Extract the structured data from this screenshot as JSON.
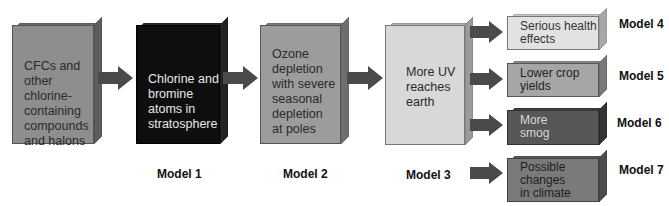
{
  "diagram": {
    "type": "flowchart",
    "boxes": [
      {
        "id": "box-cfcs",
        "text": "CFCs and other chlorine-containing compounds and halons",
        "lines": [
          "CFCs and",
          "other",
          "chlorine-",
          "containing",
          "compounds",
          "and halons"
        ],
        "fill": "#8e8e8e",
        "text_color": "#2a2a2a"
      },
      {
        "id": "box-chlorine",
        "text": "Chlorine and bromine atoms in stratosphere",
        "lines": [
          "Chlorine and",
          "bromine",
          "atoms in",
          "stratosphere"
        ],
        "fill": "#0e0e0e",
        "text_color": "#e8e8e8"
      },
      {
        "id": "box-ozone",
        "text": "Ozone depletion with severe seasonal depletion at poles",
        "lines": [
          "Ozone",
          "depletion",
          "with severe",
          "seasonal",
          "depletion",
          "at poles"
        ],
        "fill": "#9c9c9c",
        "text_color": "#2a2a2a"
      },
      {
        "id": "box-uv",
        "text": "More UV reaches earth",
        "lines": [
          "More UV",
          "reaches",
          "earth"
        ],
        "fill": "#d8d8d8",
        "text_color": "#2a2a2a"
      },
      {
        "id": "box-health",
        "text": "Serious health effects",
        "lines": [
          "Serious health",
          "effects"
        ],
        "fill": "#e2e2e2",
        "text_color": "#333333"
      },
      {
        "id": "box-crop",
        "text": "Lower crop yields",
        "lines": [
          "Lower crop",
          "yields"
        ],
        "fill": "#a6a6a6",
        "text_color": "#222222"
      },
      {
        "id": "box-smog",
        "text": "More smog",
        "lines": [
          "More",
          "smog"
        ],
        "fill": "#575757",
        "text_color": "#d8d8d8"
      },
      {
        "id": "box-climate",
        "text": "Possible changes in climate",
        "lines": [
          "Possible",
          "changes",
          "in climate"
        ],
        "fill": "#7a7a7a",
        "text_color": "#1e1e1e"
      }
    ],
    "arrows": [
      {
        "from": "box-cfcs",
        "to": "box-chlorine"
      },
      {
        "from": "box-chlorine",
        "to": "box-ozone"
      },
      {
        "from": "box-ozone",
        "to": "box-uv"
      },
      {
        "from": "box-uv",
        "to": "box-health"
      },
      {
        "from": "box-uv",
        "to": "box-crop"
      },
      {
        "from": "box-uv",
        "to": "box-smog"
      },
      {
        "from": "box-uv",
        "to": "box-climate"
      }
    ],
    "labels": {
      "model1": "Model 1",
      "model2": "Model 2",
      "model3": "Model 3",
      "model4": "Model 4",
      "model5": "Model 5",
      "model6": "Model 6",
      "model7": "Model 7"
    },
    "colors": {
      "arrow": "#4a4a4a",
      "label": "#111111"
    }
  }
}
